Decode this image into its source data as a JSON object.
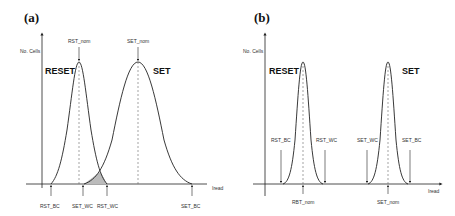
{
  "panel_a": {
    "label": "(a)",
    "y_axis_label": "No. Cells",
    "x_axis_label": "Iread",
    "reset_label": "RESET",
    "set_label": "SET",
    "top_markers": {
      "rst_nom": "RST_nom",
      "set_nom": "SET_nom"
    },
    "bottom_markers": {
      "rst_bc": "RST_BC",
      "set_wc": "SET_WC",
      "rst_wc": "RST_WC",
      "set_bc": "SET_BC"
    }
  },
  "panel_b": {
    "label": "(b)",
    "y_axis_label": "No. Cells",
    "x_axis_label": "Iread",
    "reset_label": "RESET",
    "set_label": "SET",
    "side_markers": {
      "rst_bc": "RST_BC",
      "rst_wc": "RST_WC",
      "set_wc": "SET_WC",
      "set_bc": "SET_BC"
    },
    "bottom_markers": {
      "rst_nom": "RBT_nom",
      "set_nom": "SET_nom"
    }
  },
  "colors": {
    "line": "#222222",
    "overlap_fill": "#bbbbbb",
    "dashed": "#666666"
  }
}
